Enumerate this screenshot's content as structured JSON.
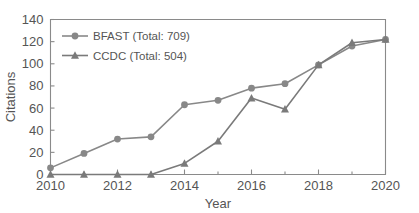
{
  "chart_data": {
    "type": "line",
    "title": "",
    "xlabel": "Year",
    "ylabel": "Citations",
    "x": [
      2010,
      2011,
      2012,
      2013,
      2014,
      2015,
      2016,
      2017,
      2018,
      2019,
      2020
    ],
    "xlim": [
      2010,
      2020
    ],
    "ylim": [
      0,
      140
    ],
    "xticks": [
      2010,
      2012,
      2014,
      2016,
      2018,
      2020
    ],
    "xtick_labels": [
      "2010",
      "2012",
      "2014",
      "2016",
      "2018",
      "2020"
    ],
    "yticks": [
      0,
      20,
      40,
      60,
      80,
      100,
      120,
      140
    ],
    "ytick_labels": [
      "0",
      "20",
      "40",
      "60",
      "80",
      "100",
      "120",
      "140"
    ],
    "xminor_ticks": [
      2011,
      2013,
      2015,
      2017,
      2019
    ],
    "grid": false,
    "legend_position": "top-left",
    "series": [
      {
        "name": "BFAST (Total: 709)",
        "short_name": "BFAST",
        "total": 709,
        "marker": "circle",
        "color": "#888888",
        "values": [
          6,
          19,
          32,
          34,
          63,
          67,
          78,
          82,
          99,
          116,
          122
        ]
      },
      {
        "name": "CCDC (Total: 504)",
        "short_name": "CCDC",
        "total": 504,
        "marker": "triangle",
        "color": "#7a7a7a",
        "values": [
          0,
          0,
          0,
          0,
          10,
          30,
          69,
          59,
          99,
          119,
          122
        ]
      }
    ]
  },
  "axis": {
    "ylabel": "Citations",
    "xlabel": "Year"
  },
  "legend": {
    "items": [
      {
        "label": "BFAST (Total: 709)"
      },
      {
        "label": "CCDC (Total: 504)"
      }
    ]
  },
  "colors": {
    "series_bfast": "#888888",
    "series_ccdc": "#7a7a7a",
    "axis": "#8a8a8a",
    "text": "#555555",
    "background": "#ffffff"
  }
}
